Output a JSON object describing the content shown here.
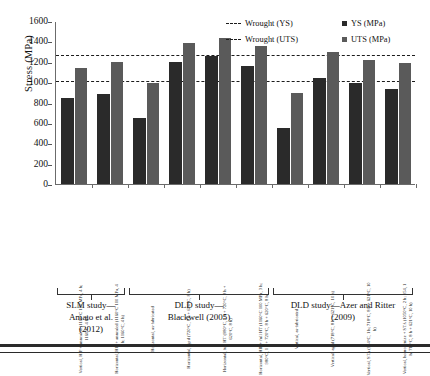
{
  "chart_data": {
    "type": "bar",
    "title": "",
    "xlabel": "",
    "ylabel": "Stress (MPa)",
    "ylim": [
      0,
      1600
    ],
    "yticks": [
      0,
      200,
      400,
      600,
      800,
      1000,
      1200,
      1400,
      1600
    ],
    "grid": false,
    "legend_position": "top-right",
    "categories": [
      "Vertical, HIP + annealed (1160°C 100 MPa, 4 h; 1160°C, 4 h)",
      "Horizontal, HIP + annealed (1160°C 100 MPa, 4 h; 1160°C, 4 h)",
      "Horizontal, as-fabricated",
      "Horizontal, aged (720°C, 8 h + 620°C, 8 h)",
      "Horizontal, full HT (980°C, 1 h + 720°C, 8 h + 620°C, 8 h)",
      "Horizontal, HIP + full HT (1160°C 100 MPa, 3 h; 980°C, 1 h + 720°C, 8 h + 620°C, 8 h)",
      "Vertical, as-fabricated",
      "Vertical, aged (718°C, 8 h + 621°C, 10 h)",
      "Vertical, STA (954°C, 1 h; 718°C, 8 h + 621°C, 10 h)",
      "Vertical, homogenize + STA (1050°C, 2 h; 954, 1 h; 718°C, 8 h + 621°C, 10 h)"
    ],
    "series": [
      {
        "name": "YS (MPa)",
        "color": "#2a2a2a",
        "values": [
          845,
          880,
          645,
          1200,
          1260,
          1155,
          550,
          1040,
          995,
          930
        ]
      },
      {
        "name": "UTS (MPa)",
        "color": "#5a5a5a",
        "values": [
          1135,
          1200,
          990,
          1385,
          1435,
          1355,
          890,
          1295,
          1215,
          1190
        ]
      }
    ],
    "reference_lines": [
      {
        "label": "Wrought (YS)",
        "value": 1020,
        "style": "dashed",
        "color": "#1c1c1c"
      },
      {
        "label": "Wrought (UTS)",
        "value": 1280,
        "style": "dashed",
        "color": "#1c1c1c"
      }
    ],
    "groups": [
      {
        "label": "SLM study—Amato et al. (2012)",
        "start_index": 0,
        "end_index": 1
      },
      {
        "label": "DLD study—Blackwell (2005)",
        "start_index": 2,
        "end_index": 5
      },
      {
        "label": "DLD study—Azer and Ritter (2009)",
        "start_index": 6,
        "end_index": 9
      }
    ]
  },
  "legend": {
    "items": [
      {
        "label": "Wrought (YS)",
        "marker": "dashed-line"
      },
      {
        "label": "YS (MPa)",
        "marker": "square-dark"
      },
      {
        "label": "Wrought (UTS)",
        "marker": "dashed-line"
      },
      {
        "label": "UTS (MPa)",
        "marker": "square-gray"
      }
    ]
  },
  "axis": {
    "y_title": "Stress (MPa)",
    "y_tick_labels": [
      "1600",
      "1400",
      "1200",
      "1000",
      "800",
      "600",
      "400",
      "200",
      "0"
    ]
  },
  "group_captions": [
    "SLM study—\nAmato et al.\n(2012)",
    "DLD study—\nBlackwell (2005)",
    "DLD study—Azer and Ritter\n(2009)"
  ]
}
